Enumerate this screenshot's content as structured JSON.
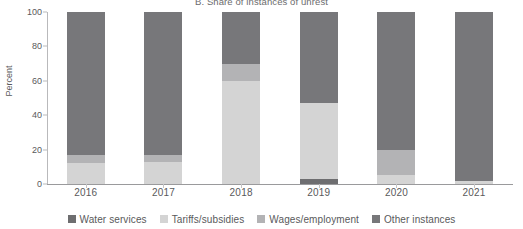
{
  "chart_data": {
    "type": "bar",
    "subtype": "stacked-bar-100",
    "title": "B. Share of instances of unrest",
    "xlabel": "",
    "ylabel": "Percent",
    "ylim": [
      0,
      100
    ],
    "yticks": [
      0,
      20,
      40,
      60,
      80,
      100
    ],
    "ytick_labels": [
      "0",
      "20",
      "40",
      "60",
      "80",
      "100"
    ],
    "grid": false,
    "legend_position": "bottom",
    "categories": [
      "2016",
      "2017",
      "2018",
      "2019",
      "2020",
      "2021"
    ],
    "series": [
      {
        "name": "Water services",
        "color": "#6e6e70",
        "values": [
          0,
          0,
          0,
          3,
          0,
          0
        ]
      },
      {
        "name": "Tariffs/subsidies",
        "color": "#d4d4d4",
        "values": [
          12,
          13,
          60,
          44,
          5,
          2
        ]
      },
      {
        "name": "Wages/employment",
        "color": "#b3b3b5",
        "values": [
          5,
          4,
          10,
          0,
          15,
          0
        ]
      },
      {
        "name": "Other instances",
        "color": "#77777a",
        "values": [
          83,
          83,
          30,
          53,
          80,
          98
        ]
      }
    ]
  },
  "legend": {
    "items": [
      {
        "label": "Water services",
        "color": "#6e6e70"
      },
      {
        "label": "Tariffs/subsidies",
        "color": "#d4d4d4"
      },
      {
        "label": "Wages/employment",
        "color": "#b3b3b5"
      },
      {
        "label": "Other instances",
        "color": "#77777a"
      }
    ]
  },
  "axis": {
    "y_title": "Percent",
    "y_ticks": [
      "100",
      "80",
      "60",
      "40",
      "20",
      "0"
    ],
    "x_ticks": [
      "2016",
      "2017",
      "2018",
      "2019",
      "2020",
      "2021"
    ]
  }
}
